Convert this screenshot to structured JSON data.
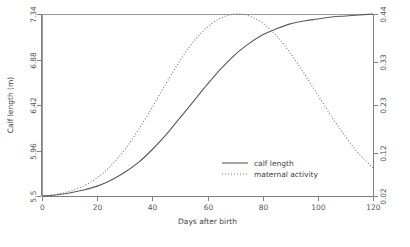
{
  "chart_data": {
    "type": "line",
    "title": "",
    "xlabel": "Days after birth",
    "ylabel": "Calf length (m)",
    "ylabel_right": "",
    "xlim": [
      0,
      120
    ],
    "ylim": [
      5.5,
      7.34
    ],
    "ylim_right": [
      0.02,
      0.44
    ],
    "grid": false,
    "legend_position": "center-right-inside",
    "x_ticks": [
      0,
      20,
      40,
      60,
      80,
      100,
      120
    ],
    "x_tick_labels": [
      "0",
      "20",
      "40",
      "60",
      "80",
      "100",
      "120"
    ],
    "y_ticks_left": [
      5.5,
      5.96,
      6.42,
      6.88,
      7.34
    ],
    "y_tick_labels_left": [
      "5.5",
      "5.96",
      "6.42",
      "6.88",
      "7.34"
    ],
    "y_ticks_right": [
      0.02,
      0.12,
      0.23,
      0.33,
      0.44
    ],
    "y_tick_labels_right": [
      "0.02",
      "0.12",
      "0.23",
      "0.33",
      "0.44"
    ],
    "x": [
      0,
      5,
      10,
      15,
      20,
      25,
      30,
      35,
      40,
      45,
      50,
      55,
      60,
      65,
      70,
      75,
      80,
      85,
      90,
      95,
      100,
      105,
      110,
      115,
      120
    ],
    "series": [
      {
        "name": "calf length",
        "axis": "left",
        "style": "solid",
        "color": "#5a5a5a",
        "values": [
          5.5,
          5.51,
          5.53,
          5.56,
          5.6,
          5.66,
          5.74,
          5.84,
          5.97,
          6.12,
          6.29,
          6.46,
          6.63,
          6.79,
          6.93,
          7.04,
          7.13,
          7.19,
          7.24,
          7.27,
          7.29,
          7.31,
          7.32,
          7.33,
          7.34
        ]
      },
      {
        "name": "maternal activity",
        "axis": "right",
        "style": "dotted",
        "color": "#7a7a7a",
        "values": [
          0.02,
          0.024,
          0.031,
          0.043,
          0.062,
          0.09,
          0.127,
          0.173,
          0.225,
          0.28,
          0.332,
          0.377,
          0.41,
          0.431,
          0.44,
          0.436,
          0.419,
          0.39,
          0.35,
          0.303,
          0.253,
          0.203,
          0.157,
          0.117,
          0.085
        ]
      }
    ]
  },
  "legend": {
    "items": [
      {
        "label": "calf length",
        "style": "solid"
      },
      {
        "label": "maternal activity",
        "style": "dotted"
      }
    ]
  }
}
